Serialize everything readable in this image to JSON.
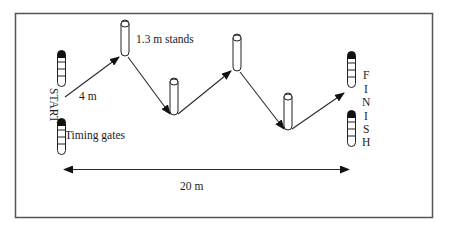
{
  "diagram": {
    "type": "course-layout",
    "labels": {
      "start": "START",
      "finish_letters": [
        "F",
        "I",
        "N",
        "I",
        "S",
        "H"
      ],
      "stands": "1.3 m stands",
      "timing_gates": "Timing gates",
      "first_leg": "4 m",
      "total_length": "20 m"
    },
    "colors": {
      "line": "#2a2a2a",
      "frame": "#555555",
      "gate_cap": "#111111",
      "background": "#ffffff"
    },
    "nodes": [
      {
        "id": "start-gate-top",
        "kind": "timing-gate"
      },
      {
        "id": "start-gate-bottom",
        "kind": "timing-gate"
      },
      {
        "id": "stand-1",
        "kind": "stand"
      },
      {
        "id": "stand-2",
        "kind": "stand"
      },
      {
        "id": "stand-3",
        "kind": "stand"
      },
      {
        "id": "stand-4",
        "kind": "stand"
      },
      {
        "id": "finish-gate-top",
        "kind": "timing-gate"
      },
      {
        "id": "finish-gate-bottom",
        "kind": "timing-gate"
      }
    ],
    "edges": [
      {
        "from": "start",
        "to": "stand-1",
        "label": "4 m"
      },
      {
        "from": "stand-1",
        "to": "stand-2"
      },
      {
        "from": "stand-2",
        "to": "stand-3"
      },
      {
        "from": "stand-3",
        "to": "stand-4"
      },
      {
        "from": "stand-4",
        "to": "finish"
      },
      {
        "from": "start",
        "to": "finish",
        "label": "20 m",
        "bidirectional": true
      }
    ]
  }
}
